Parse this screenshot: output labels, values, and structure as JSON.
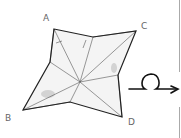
{
  "diagram": {
    "type": "origami-step",
    "labels": {
      "a": "A",
      "b": "B",
      "c": "C",
      "d": "D"
    },
    "symbols": [
      "turn-over-arrow"
    ],
    "colors": {
      "outline": "#222222",
      "crease": "#555555",
      "paper": "#f4f4f4",
      "shade": "#bbbbbb",
      "label": "#666666",
      "divider": "#aaaaaa"
    }
  }
}
